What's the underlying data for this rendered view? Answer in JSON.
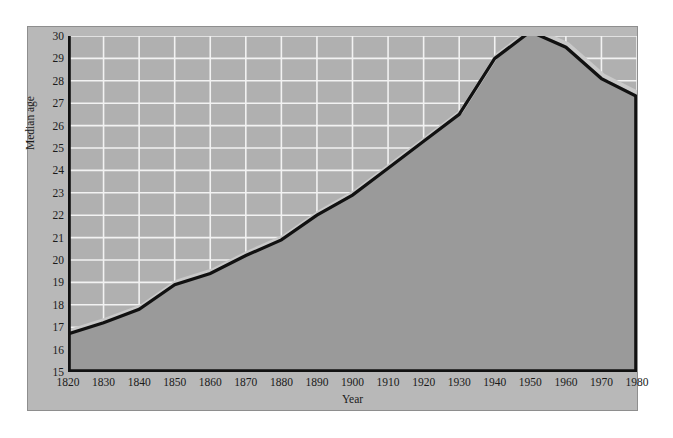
{
  "chart_data": {
    "type": "area",
    "title": "",
    "xlabel": "Year",
    "ylabel": "Median age",
    "xlim": [
      1820,
      1980
    ],
    "ylim": [
      15,
      30
    ],
    "grid": true,
    "legend": "none",
    "x_ticks": [
      1820,
      1830,
      1840,
      1850,
      1860,
      1870,
      1880,
      1890,
      1900,
      1910,
      1920,
      1930,
      1940,
      1950,
      1960,
      1970,
      1980
    ],
    "y_ticks": [
      15,
      16,
      17,
      18,
      19,
      20,
      21,
      22,
      23,
      24,
      25,
      26,
      27,
      28,
      29,
      30
    ],
    "x": [
      1820,
      1830,
      1840,
      1850,
      1860,
      1870,
      1880,
      1890,
      1900,
      1910,
      1920,
      1930,
      1940,
      1950,
      1960,
      1970,
      1980
    ],
    "values": [
      16.7,
      17.2,
      17.8,
      18.9,
      19.4,
      20.2,
      20.9,
      22.0,
      22.9,
      24.1,
      25.3,
      26.5,
      29.0,
      30.2,
      29.5,
      28.1,
      27.3
    ],
    "series": [
      {
        "name": "Median age",
        "values": [
          16.7,
          17.2,
          17.8,
          18.9,
          19.4,
          20.2,
          20.9,
          22.0,
          22.9,
          24.1,
          25.3,
          26.5,
          29.0,
          30.2,
          29.5,
          28.1,
          27.3
        ]
      }
    ],
    "colors": {
      "panel": "#b8b8b8",
      "plot_bg": "#b0b0b0",
      "fill": "#9a9a9a",
      "line": "#111111",
      "grid": "#f2f2f2",
      "axis": "#111111",
      "text": "#1a1a1a"
    }
  }
}
